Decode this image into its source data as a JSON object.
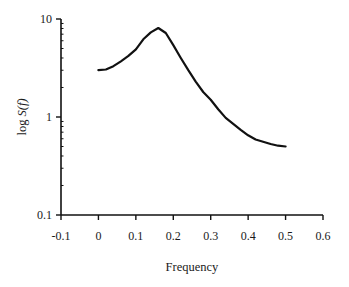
{
  "chart_data": {
    "type": "line",
    "title": "",
    "xlabel": "Frequency",
    "ylabel": "log S(f)",
    "ylabel_parts": {
      "prefix": "log ",
      "italic": "S(f)"
    },
    "y_scale": "log",
    "xlim": [
      -0.1,
      0.6
    ],
    "ylim": [
      0.1,
      10
    ],
    "x_ticks": [
      -0.1,
      0,
      0.1,
      0.2,
      0.3,
      0.4,
      0.5,
      0.6
    ],
    "x_tick_labels": [
      "-0.1",
      "0",
      "0.1",
      "0.2",
      "0.3",
      "0.4",
      "0.5",
      "0.6"
    ],
    "y_ticks": [
      0.1,
      1,
      10
    ],
    "y_tick_labels": [
      "0.1",
      "1",
      "10"
    ],
    "grid": false,
    "legend": null,
    "series": [
      {
        "name": "S(f)",
        "color": "#111111",
        "x": [
          0.0,
          0.02,
          0.04,
          0.06,
          0.08,
          0.1,
          0.12,
          0.14,
          0.16,
          0.18,
          0.2,
          0.22,
          0.24,
          0.26,
          0.28,
          0.3,
          0.32,
          0.34,
          0.36,
          0.38,
          0.4,
          0.42,
          0.44,
          0.46,
          0.48,
          0.5
        ],
        "values": [
          3.0,
          3.05,
          3.3,
          3.7,
          4.2,
          4.9,
          6.2,
          7.3,
          8.1,
          7.2,
          5.4,
          4.0,
          3.0,
          2.3,
          1.8,
          1.5,
          1.2,
          0.98,
          0.85,
          0.74,
          0.65,
          0.59,
          0.56,
          0.53,
          0.51,
          0.5
        ]
      }
    ]
  }
}
